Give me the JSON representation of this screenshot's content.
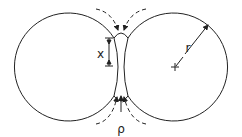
{
  "diagram": {
    "labels": {
      "neck_radius": "x",
      "neck_curvature": "ρ",
      "sphere_radius": "r"
    },
    "colors": {
      "stroke": "#222222",
      "background": "#ffffff"
    }
  }
}
